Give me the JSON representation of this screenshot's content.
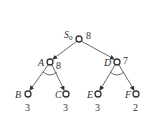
{
  "diagram": {
    "type": "and-or-tree",
    "nodes": [
      {
        "id": "S0",
        "label": "S",
        "sub": "0",
        "value": "8",
        "x": 79,
        "y": 39
      },
      {
        "id": "A",
        "label": "A",
        "value": "8",
        "x": 50,
        "y": 62
      },
      {
        "id": "D",
        "label": "D",
        "value": "7",
        "x": 117,
        "y": 62
      },
      {
        "id": "B",
        "label": "B",
        "value": "3",
        "x": 28,
        "y": 94
      },
      {
        "id": "C",
        "label": "C",
        "value": "3",
        "x": 66,
        "y": 94
      },
      {
        "id": "E",
        "label": "E",
        "value": "3",
        "x": 98,
        "y": 94
      },
      {
        "id": "F",
        "label": "F",
        "value": "2",
        "x": 136,
        "y": 94
      }
    ],
    "edges": [
      [
        "S0",
        "A"
      ],
      [
        "S0",
        "D"
      ],
      [
        "A",
        "B"
      ],
      [
        "A",
        "C"
      ],
      [
        "D",
        "E"
      ],
      [
        "D",
        "F"
      ]
    ],
    "and_arcs": [
      "A",
      "D"
    ]
  }
}
